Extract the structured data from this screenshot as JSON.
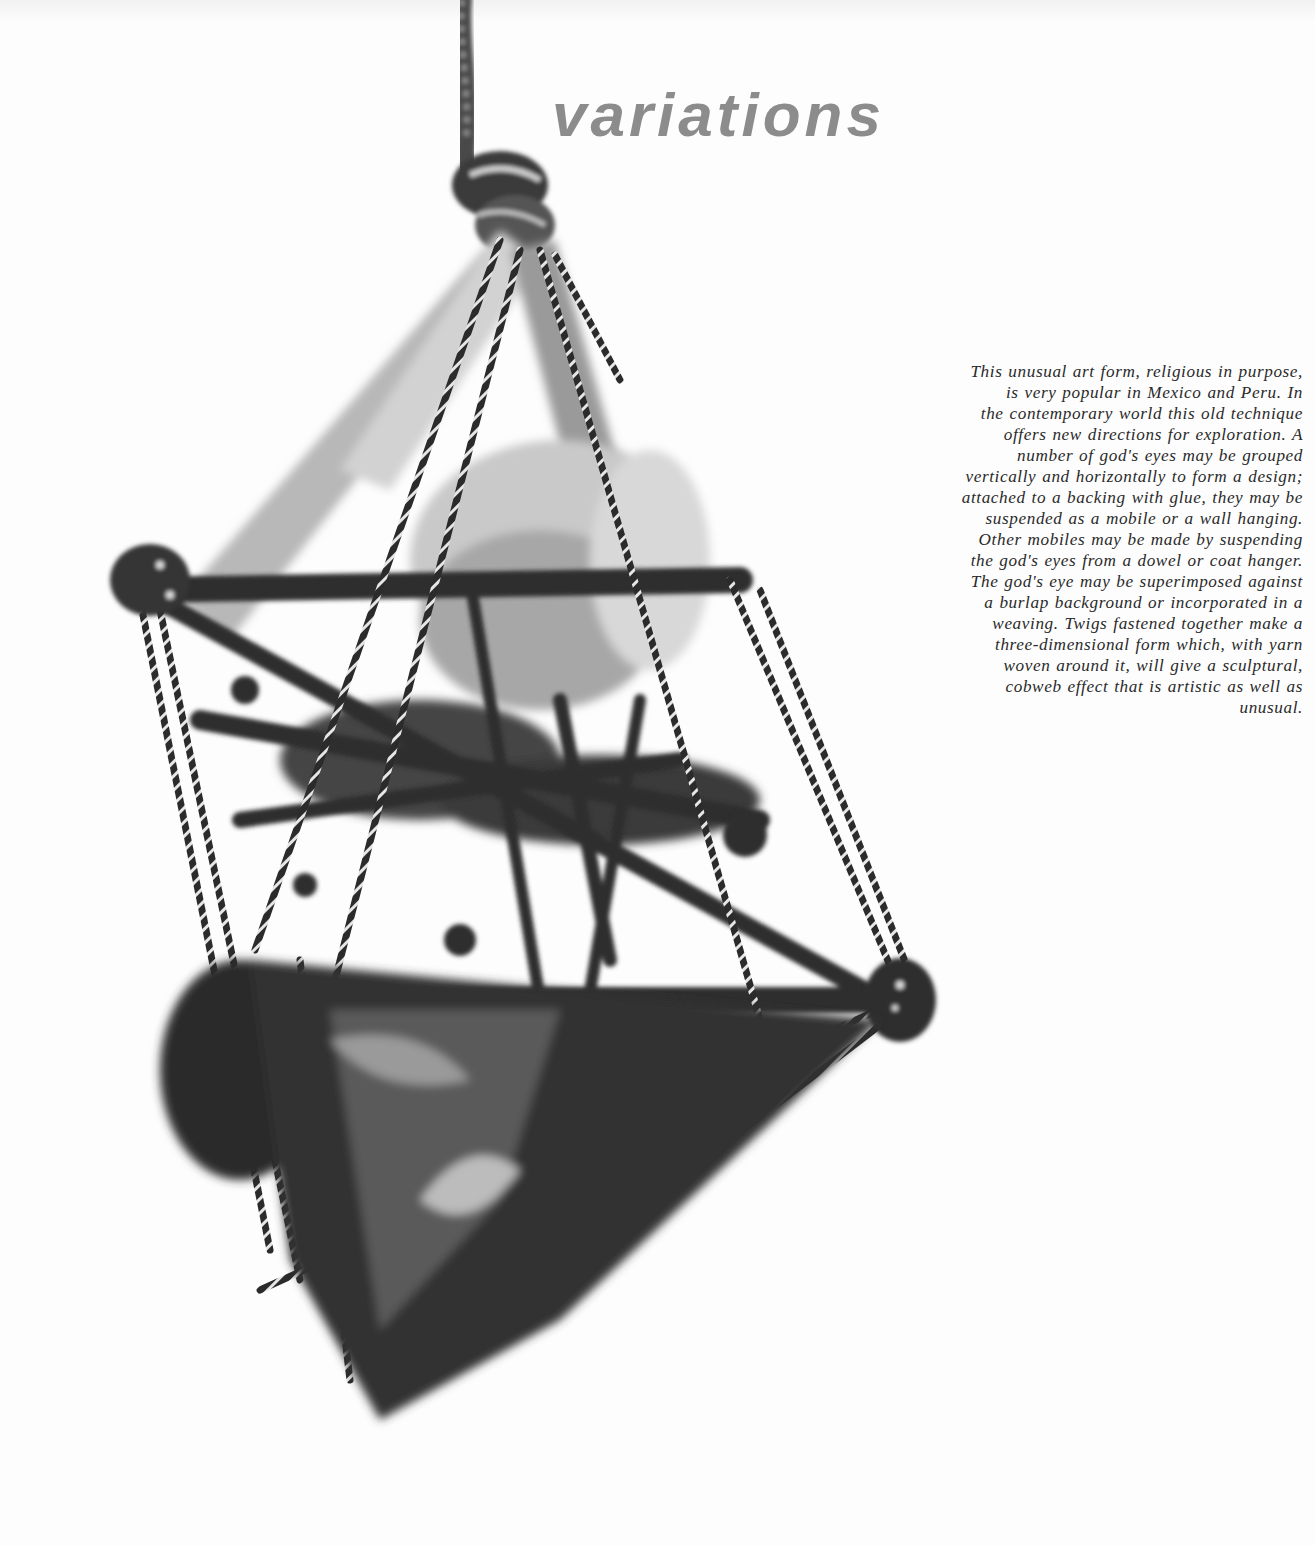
{
  "page": {
    "title": "variations",
    "photo": {
      "subject": "three-dimensional god's eye sculpture hanging from a rope",
      "alt": "Black-and-white photo of a sculptural god's eye made of twigs and yarn, suspended by a twisted rope"
    },
    "caption": {
      "lines": [
        "This unusual art form, religious in purpose,",
        "is very popular in Mexico and Peru.  In",
        "the contemporary world this old technique",
        "offers new directions for exploration.  A",
        "number of god's eyes may be grouped",
        "vertically and horizontally to form a design;",
        "attached to a backing with glue, they may be",
        "suspended as a mobile or a wall hanging.",
        "Other mobiles may be made by suspending",
        "the god's eyes from a dowel or coat hanger.",
        "The god's eye may be superimposed against",
        "a burlap background or incorporated in a",
        "weaving.  Twigs fastened together make a",
        "three-dimensional form which, with yarn",
        "woven around it, will give a sculptural,",
        "cobweb effect that is artistic as well as",
        "unusual."
      ]
    },
    "colors": {
      "title": "#8c8c8c",
      "text": "#2a2a2a",
      "background": "#fdfdfd",
      "photo_dark": "#2b2b2b",
      "photo_mid": "#6e6e6e",
      "photo_light": "#bdbdbd"
    }
  }
}
